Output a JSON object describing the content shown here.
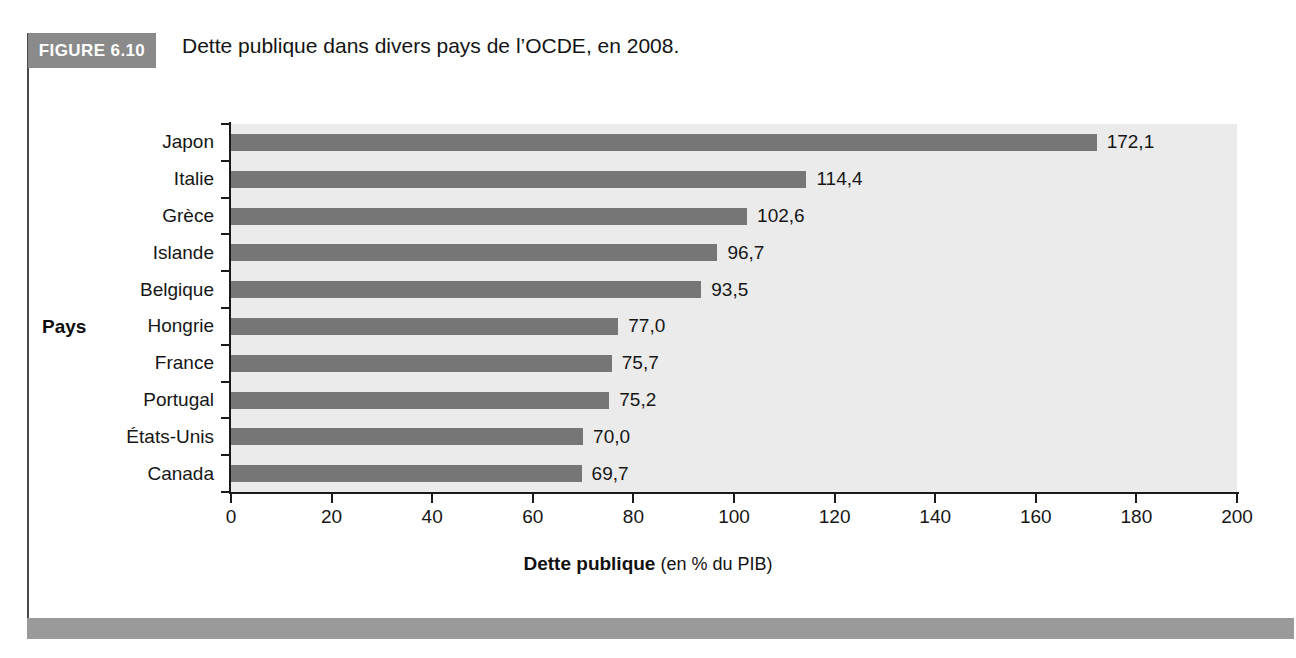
{
  "figure": {
    "badge_label": "FIGURE 6.10",
    "caption": "Dette publique dans divers pays de l’OCDE, en 2008."
  },
  "axis": {
    "group_label": "Pays",
    "x_title_strong": "Dette publique",
    "x_title_light": "(en % du PIB)"
  },
  "colors": {
    "badge_bg": "#8a8a8a",
    "bar_fill": "#767676",
    "plot_bg": "#ebebeb",
    "bottom_bar": "#9a9a9a",
    "axis_line": "#1a1a1a",
    "text": "#161616"
  },
  "chart_data": {
    "type": "bar",
    "orientation": "horizontal",
    "title": "Dette publique dans divers pays de l’OCDE, en 2008.",
    "xlabel": "Dette publique (en % du PIB)",
    "ylabel": "Pays",
    "xlim": [
      0,
      200
    ],
    "xticks": [
      0,
      20,
      40,
      60,
      80,
      100,
      120,
      140,
      160,
      180,
      200
    ],
    "xtick_labels": [
      "0",
      "20",
      "40",
      "60",
      "80",
      "100",
      "120",
      "140",
      "160",
      "180",
      "200"
    ],
    "grid": false,
    "legend": "none",
    "categories": [
      "Japon",
      "Italie",
      "Grèce",
      "Islande",
      "Belgique",
      "Hongrie",
      "France",
      "Portugal",
      "États-Unis",
      "Canada"
    ],
    "values": [
      172.1,
      114.4,
      102.6,
      96.7,
      93.5,
      77.0,
      75.7,
      75.2,
      70.0,
      69.7
    ],
    "value_labels": [
      "172,1",
      "114,4",
      "102,6",
      "96,7",
      "93,5",
      "77,0",
      "75,7",
      "75,2",
      "70,0",
      "69,7"
    ],
    "bars": [
      {
        "category": "Japon",
        "value": 172.1,
        "label": "172,1"
      },
      {
        "category": "Italie",
        "value": 114.4,
        "label": "114,4"
      },
      {
        "category": "Grèce",
        "value": 102.6,
        "label": "102,6"
      },
      {
        "category": "Islande",
        "value": 96.7,
        "label": "96,7"
      },
      {
        "category": "Belgique",
        "value": 93.5,
        "label": "93,5"
      },
      {
        "category": "Hongrie",
        "value": 77.0,
        "label": "77,0"
      },
      {
        "category": "France",
        "value": 75.7,
        "label": "75,7"
      },
      {
        "category": "Portugal",
        "value": 75.2,
        "label": "75,2"
      },
      {
        "category": "États-Unis",
        "value": 70.0,
        "label": "70,0"
      },
      {
        "category": "Canada",
        "value": 69.7,
        "label": "69,7"
      }
    ]
  }
}
